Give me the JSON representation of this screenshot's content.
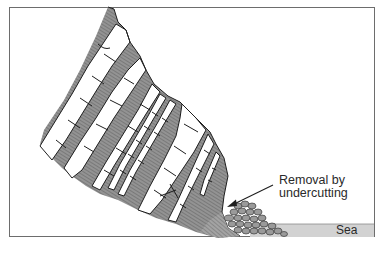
{
  "figure": {
    "type": "cross-section diagram"
  },
  "labels": {
    "callout": [
      "Removal by",
      "undercutting"
    ],
    "sea": "Sea"
  },
  "colors": {
    "frame": "#6d6d6d",
    "strata_fill": "#8e8e8e",
    "strata_hatch": "#5e5e5e",
    "block_fill": "#ffffff",
    "outline": "#1e1e1e",
    "sea_fill": "#cfcfcf",
    "boulder_fill": "#9a9a9a",
    "arrow": "#1e1e1e"
  }
}
